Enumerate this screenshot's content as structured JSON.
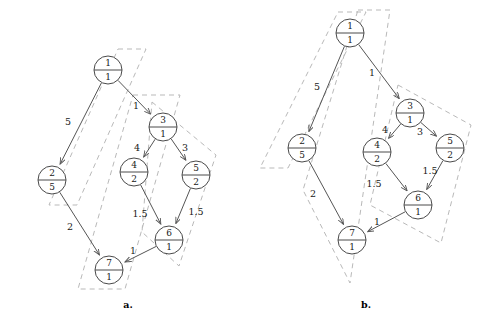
{
  "figure": {
    "title": "",
    "panels": [
      {
        "id": "a",
        "caption": "a.",
        "caption_pos": [
          128,
          308
        ],
        "nodes": [
          {
            "id": "1",
            "top": "1",
            "bottom": "1",
            "cx": 108,
            "cy": 70,
            "r": 14
          },
          {
            "id": "2",
            "top": "2",
            "bottom": "5",
            "cx": 52,
            "cy": 180,
            "r": 14
          },
          {
            "id": "3",
            "top": "3",
            "bottom": "1",
            "cx": 163,
            "cy": 127,
            "r": 14
          },
          {
            "id": "4",
            "top": "4",
            "bottom": "2",
            "cx": 134,
            "cy": 172,
            "r": 14
          },
          {
            "id": "5",
            "top": "5",
            "bottom": "2",
            "cx": 196,
            "cy": 175,
            "r": 14
          },
          {
            "id": "6",
            "top": "6",
            "bottom": "1",
            "cx": 169,
            "cy": 240,
            "r": 14
          },
          {
            "id": "7",
            "top": "7",
            "bottom": "1",
            "cx": 109,
            "cy": 270,
            "r": 14
          }
        ],
        "edges": [
          {
            "from": "1",
            "to": "2",
            "weight": "5",
            "label_pos": [
              68,
              122
            ]
          },
          {
            "from": "1",
            "to": "3",
            "weight": "1",
            "label_pos": [
              136,
              106
            ]
          },
          {
            "from": "3",
            "to": "4",
            "weight": "4",
            "label_pos": [
              137,
              148
            ]
          },
          {
            "from": "3",
            "to": "5",
            "weight": "3",
            "label_pos": [
              185,
              148
            ]
          },
          {
            "from": "4",
            "to": "6",
            "weight": "1.5",
            "label_pos": [
              140,
              214
            ]
          },
          {
            "from": "5",
            "to": "6",
            "weight": "1.5",
            "label_pos": [
              196,
              212
            ]
          },
          {
            "from": "2",
            "to": "7",
            "weight": "2",
            "label_pos": [
              70,
              227
            ]
          },
          {
            "from": "6",
            "to": "7",
            "weight": "1",
            "label_pos": [
              133,
              251
            ]
          }
        ],
        "regions": [
          {
            "name": "region-a-1",
            "points": "118,49 146,49 77,205 49,205"
          },
          {
            "name": "region-a-2",
            "points": "133,95 180,95 125,289 78,289"
          },
          {
            "name": "region-a-3",
            "points": "152,102 216,155 179,266 142,232"
          }
        ]
      },
      {
        "id": "b",
        "caption": "b.",
        "caption_pos": [
          366,
          308
        ],
        "nodes": [
          {
            "id": "1",
            "top": "1",
            "bottom": "1",
            "cx": 350,
            "cy": 33,
            "r": 14
          },
          {
            "id": "2",
            "top": "2",
            "bottom": "5",
            "cx": 302,
            "cy": 148,
            "r": 14
          },
          {
            "id": "3",
            "top": "3",
            "bottom": "1",
            "cx": 410,
            "cy": 113,
            "r": 14
          },
          {
            "id": "4",
            "top": "4",
            "bottom": "2",
            "cx": 377,
            "cy": 152,
            "r": 14
          },
          {
            "id": "5",
            "top": "5",
            "bottom": "2",
            "cx": 450,
            "cy": 148,
            "r": 14
          },
          {
            "id": "6",
            "top": "6",
            "bottom": "1",
            "cx": 418,
            "cy": 205,
            "r": 14
          },
          {
            "id": "7",
            "top": "7",
            "bottom": "1",
            "cx": 352,
            "cy": 240,
            "r": 14
          }
        ],
        "edges": [
          {
            "from": "1",
            "to": "2",
            "weight": "5",
            "label_pos": [
              317,
              87
            ]
          },
          {
            "from": "1",
            "to": "3",
            "weight": "1",
            "label_pos": [
              372,
              73
            ]
          },
          {
            "from": "3",
            "to": "4",
            "weight": "4",
            "label_pos": [
              385,
              130
            ]
          },
          {
            "from": "3",
            "to": "5",
            "weight": "3",
            "label_pos": [
              420,
              132
            ]
          },
          {
            "from": "4",
            "to": "6",
            "weight": "1.5",
            "label_pos": [
              374,
              184
            ]
          },
          {
            "from": "5",
            "to": "6",
            "weight": "1.5",
            "label_pos": [
              430,
              171
            ]
          },
          {
            "from": "2",
            "to": "7",
            "weight": "2",
            "label_pos": [
              313,
              194
            ]
          },
          {
            "from": "6",
            "to": "7",
            "weight": "1",
            "label_pos": [
              377,
              222
            ]
          }
        ],
        "regions": [
          {
            "name": "region-b-1",
            "points": "338,12 366,12 288,168 260,168"
          },
          {
            "name": "region-b-2",
            "points": "358,10 390,10 350,283 303,190"
          },
          {
            "name": "region-b-3",
            "points": "398,85 471,125 441,243 370,205"
          }
        ]
      }
    ]
  },
  "colors": {
    "node_stroke": "#4a4a4a",
    "edge_stroke": "#555555",
    "region_stroke": "#b9b9b9",
    "text": "#1a1a1a",
    "background": "#ffffff"
  }
}
